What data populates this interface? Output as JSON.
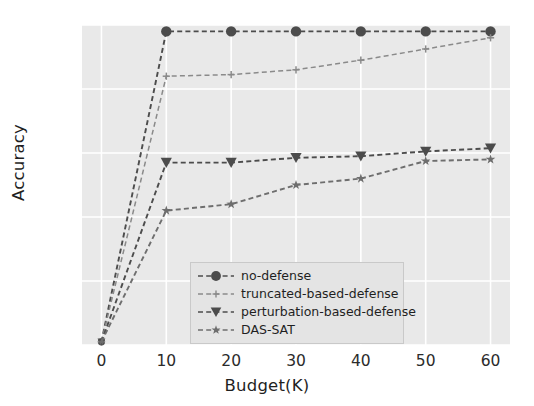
{
  "chart_data": {
    "type": "line",
    "title": "",
    "xlabel": "Budget(K)",
    "ylabel": "Accuracy",
    "x": [
      0,
      10,
      20,
      30,
      40,
      50,
      60
    ],
    "xlim": [
      -3,
      63
    ],
    "ylim": [
      0.0,
      1.0
    ],
    "xticks": [
      "0",
      "10",
      "20",
      "30",
      "40",
      "50",
      "60"
    ],
    "yticks": [
      "0.0",
      "0.2",
      "0.4",
      "0.6",
      "0.8",
      "1.0"
    ],
    "ytick_values": [
      0.0,
      0.2,
      0.4,
      0.6,
      0.8,
      1.0
    ],
    "grid": true,
    "grid_color": "#ffffff",
    "plot_background": "#e9e9e9",
    "legend_position": "lower center",
    "series": [
      {
        "name": "no-defense",
        "marker": "circle",
        "color": "#4c4c4c",
        "linestyle": "dashed",
        "values": [
          0.01,
          0.98,
          0.98,
          0.98,
          0.98,
          0.98,
          0.98
        ]
      },
      {
        "name": "truncated-based-defense",
        "marker": "plus",
        "color": "#8a8a8a",
        "linestyle": "dashed",
        "values": [
          0.01,
          0.84,
          0.845,
          0.86,
          0.89,
          0.925,
          0.96
        ]
      },
      {
        "name": "perturbation-based-defense",
        "marker": "triangle-down",
        "color": "#4c4c4c",
        "linestyle": "dashed",
        "values": [
          0.01,
          0.57,
          0.57,
          0.585,
          0.59,
          0.605,
          0.615
        ]
      },
      {
        "name": "DAS-SAT",
        "marker": "star",
        "color": "#6e6e6e",
        "linestyle": "dashed",
        "values": [
          0.01,
          0.42,
          0.44,
          0.5,
          0.52,
          0.575,
          0.58
        ]
      }
    ]
  }
}
